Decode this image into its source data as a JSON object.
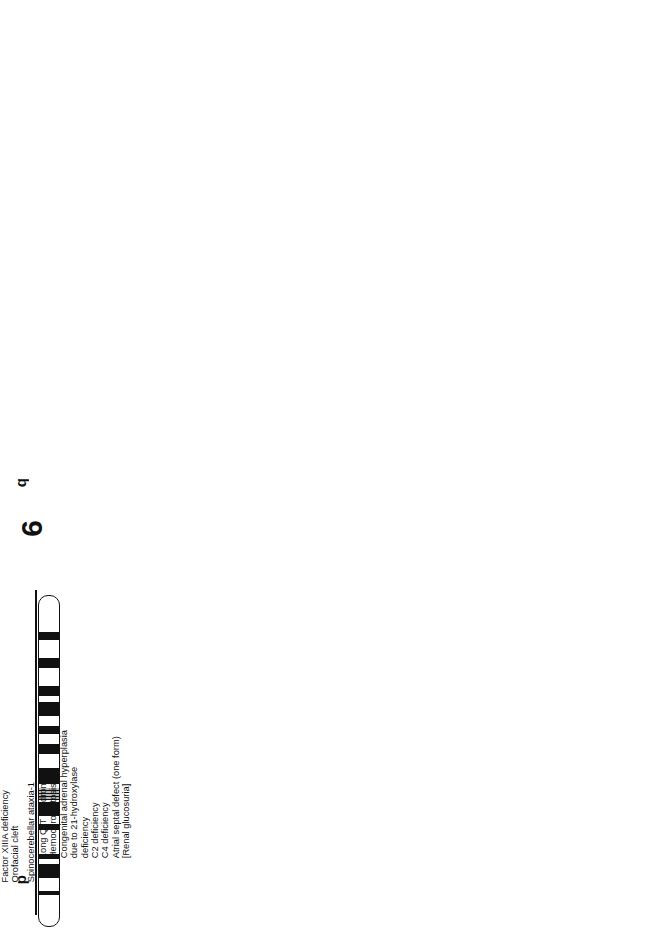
{
  "page": {
    "orientation": "rotated 90 degrees counterclockwise"
  },
  "chromosomes": [
    {
      "number": "6",
      "arms": {
        "p": "p",
        "q": "q"
      },
      "regions_p": [
        "2",
        "1"
      ],
      "regions_q": [
        "1",
        "2"
      ],
      "bands": [
        "25",
        "22",
        "21",
        "12",
        "12",
        "15",
        "16",
        "21",
        "22",
        "24",
        "27"
      ],
      "disease_groups": [
        {
          "boxed": false,
          "items": [
            "Factor XIIIA deficiency",
            "Orofacial cleft"
          ]
        },
        {
          "boxed": false,
          "items": [
            "Spinocerebellar ataxia-1"
          ]
        },
        {
          "boxed": false,
          "items": [
            "Long Q-T syndrome",
            "Hemochromatosis",
            "Congenital adrenal hyperplasia",
            "due to 21-hydroxylase",
            "deficiency",
            "C2 deficiency",
            "C4 deficiency",
            "Atrial septal defect (one form)",
            "[Renal glucosuria]"
          ]
        },
        {
          "boxed": false,
          "items": [
            "Methylmalonicaciduria, one type"
          ]
        },
        {
          "boxed": false,
          "items": [
            "Argininemia"
          ]
        },
        {
          "boxed": false,
          "items": [
            "Macular dystrophy, ?vitelline type"
          ]
        },
        {
          "boxed": true,
          "items": [
            "Dysplasminogenemic thrombophilia",
            "Plasminogen Tochigi disease",
            "Plasminogen deficiency I & II"
          ]
        },
        {
          "boxed": false,
          "items": [
            "[Coronary artery disease,",
            "susceptibility to]"
          ]
        }
      ]
    },
    {
      "number": "7",
      "arms": {
        "p": "p",
        "q": "q"
      },
      "regions_p": [
        "2",
        "1"
      ],
      "regions_q": [
        "1",
        "2",
        "3"
      ],
      "bands": [
        "22",
        "21",
        "15",
        "13",
        "11",
        "11",
        "21",
        "22",
        "31",
        "36"
      ],
      "disease_groups": [
        {
          "boxed": false,
          "items": [
            "Craniosynostosis"
          ]
        },
        {
          "boxed": false,
          "items": [
            "Myopathy due to phosphoglycerate",
            "mutase deficiency"
          ]
        },
        {
          "boxed": false,
          "items": [
            "Greig craniopolysyndactyly"
          ]
        },
        {
          "boxed": false,
          "items": [
            "Argininosuccinicaciduria",
            "Zellweger syndrome"
          ]
        },
        {
          "boxed": true,
          "items": [
            "Ehlers-Danlos syndrome",
            "type VII A2",
            "Osteogenesis imperfecta",
            "(2 or more forms)",
            "Marfan syndrome, atypical"
          ]
        },
        {
          "boxed": false,
          "items": [
            "Mucopolysaccharidosis VII",
            "Hemorrhagic diathesis due to",
            "PAI1 deficiency"
          ]
        },
        {
          "boxed": false,
          "items": [
            "Cystic fibrosis"
          ]
        },
        {
          "boxed": false,
          "items": [
            "Trypsinogen deficiency",
            "Tritan colorblindness",
            "Hemolytic anemia due to",
            "bisphosphoglycerate mutase deficiency"
          ]
        },
        {
          "boxed": false,
          "items": [
            "Lipoamide dehydrogenase",
            "deficiency"
          ]
        }
      ]
    },
    {
      "number": "8",
      "arms": {
        "p": "p",
        "q": "q"
      },
      "regions_p": [
        "2",
        "1"
      ],
      "regions_q": [
        "1",
        "2"
      ],
      "bands": [
        "23",
        "22",
        "12",
        "11",
        "11",
        "12",
        "21",
        "22",
        "23",
        "24"
      ],
      "disease_groups": [
        {
          "boxed": false,
          "items": [
            "Hyperlipoproteinemia I"
          ]
        },
        {
          "boxed": false,
          "items": [
            "Hemolytic anemia due to glutathione",
            "reductase deficiency"
          ]
        },
        {
          "boxed": false,
          "items": [
            "Plasminogen activator deficiency"
          ]
        },
        {
          "boxed": false,
          "items": [
            "Spherocytosis II"
          ]
        },
        {
          "boxed": false,
          "items": [
            "?Hypogonadotropic hypogonadism",
            "due to GNRH deficiency"
          ]
        },
        {
          "boxed": false,
          "items": [
            "Salivary gland pleomorphic adenoma*"
          ]
        },
        {
          "boxed": true,
          "items": [
            "Adrenal hyperplasia, congenital,",
            "due to 11-B-hydroxylase deficiency",
            "CMOII deficiency"
          ]
        },
        {
          "boxed": false,
          "items": [
            "Renal tubular acidosis-",
            "osteopetrosis syndrome"
          ]
        },
        {
          "boxed": false,
          "items": [
            "?Multiple exostoses",
            "Langer-Giedion syndrome*",
            "Trichorhinophalangeal syndrome -1"
          ]
        },
        {
          "boxed": true,
          "items": [
            "?Adolescent multinodular goiter",
            "Hereditary congenital hypothyroidism",
            "(1 or more forms)"
          ]
        },
        {
          "boxed": false,
          "items": [
            "Burkitt lymphoma*",
            "Epidermolysis bullosa, Ogna type",
            "Macular dystrophy, atypical vitelliform"
          ]
        }
      ]
    },
    {
      "number": "9",
      "arms": {
        "p": "p",
        "q": "q"
      },
      "regions_p": [
        "2",
        "1"
      ],
      "regions_q": [
        "1",
        "2",
        "3"
      ],
      "bands": [
        "24",
        "21",
        "13",
        "12",
        "21",
        "22",
        "31",
        "34"
      ],
      "disease_groups": [
        {
          "boxed": false,
          "items": [
            "Interferon deficiency"
          ]
        },
        {
          "boxed": false,
          "items": [
            "Galactosemia"
          ]
        },
        {
          "boxed": false,
          "items": [
            "Friedreich ataxia"
          ]
        },
        {
          "boxed": false,
          "items": [
            "Fructose intolerance"
          ]
        },
        {
          "boxed": true,
          "items": [
            "Citrullinemia",
            "Acute hepatic porphyria",
            "Lead poisoning, suscep-",
            "tibility to"
          ]
        },
        {
          "boxed": false,
          "items": [
            "Nail-patella syndrome"
          ]
        },
        {
          "boxed": false,
          "items": [
            "Hemolytic anemia due",
            "to adenylate",
            "kinase deficiency",
            "Chronic myeloid leukemia*",
            "C5 deficiency"
          ]
        },
        {
          "boxed": false,
          "items": [
            "Tuberous sclerosis-1"
          ]
        },
        {
          "boxed": true,
          "items": [
            "Coproporphyria",
            "Harderoporphyria"
          ]
        }
      ]
    },
    {
      "number": "10",
      "arms": {
        "p": "p",
        "q": "q"
      },
      "regions_p": [
        "1"
      ],
      "regions_q": [
        "1",
        "2"
      ],
      "bands": [
        "15",
        "12",
        "11",
        "11",
        "21",
        "23",
        "25"
      ],
      "disease_groups": [
        {
          "boxed": false,
          "items": [
            "Glioblastoma multiforme"
          ]
        },
        {
          "boxed": false,
          "items": [
            "Hemolytic anemia due to",
            "hexokinase deficiency"
          ]
        },
        {
          "boxed": false,
          "items": [
            "Multiple endocrine neoplasia II",
            "Multiple endocrine neoplasia III"
          ]
        },
        {
          "boxed": false,
          "items": [
            "Metachromatic leukodystrophy",
            "due to deficiency of SAP-1"
          ]
        },
        {
          "boxed": false,
          "items": [
            "Thyroid papillary carcinoma"
          ]
        },
        {
          "boxed": false,
          "items": [
            "Leukemia, T-cell acute lymphocytic*"
          ]
        },
        {
          "boxed": true,
          "items": [
            "Wolman disease",
            "Cholesterol ester storage disease"
          ]
        },
        {
          "boxed": true,
          "items": [
            "Ornithinemia,",
            "B6-responsive & B6-unresponsive"
          ]
        },
        {
          "boxed": false,
          "items": [
            "Gyrate atrophy of choroid and retina"
          ]
        },
        {
          "boxed": false,
          "items": [
            "Adrenal hyperplasia V",
            "Chronic granulomatous disease due to deficiency",
            "of NCF-1",
            "Retinol binding protein, deficiency of",
            "?Sialidosis"
          ]
        }
      ]
    },
    {
      "number": "11",
      "arms": {
        "p": "p",
        "q": "q"
      },
      "regions_p": [
        "1"
      ],
      "regions_q": [
        "1",
        "2"
      ],
      "bands": [
        "15",
        "14",
        "11",
        "13",
        "22",
        "23"
      ],
      "disease_groups": [
        {
          "boxed": false,
          "items": [
            "Rhabdomyosarcoma",
            "Adrenocortical carcinoma",
            "Beckwith-Wiedemann syndrome*",
            "Manic-depressive illness"
          ]
        },
        {
          "boxed": true,
          "items": [
            "Hyperproinsulinemia, familial",
            "MODY",
            "Diabetes mellitus, rare form"
          ]
        },
        {
          "boxed": false,
          "items": [
            "Heterocellular hereditary persistence of fetal hemoglobin"
          ]
        },
        {
          "boxed": true,
          "items": [
            "Sickle cell anemia",
            "B-thalassemias",
            "B-methemoglobinemias",
            "B-erythremias",
            "B-Heinz body anemias",
            "HPFH, deletion type"
          ]
        },
        {
          "boxed": false,
          "items": [
            "HPFH, nondeletion types A, G",
            "Wilms tumor, type 2*"
          ]
        },
        {
          "boxed": false,
          "items": [
            "Wilms tumor*",
            "Aniridia-2*",
            "Acatalasemia",
            "Leukemia, acute T-cell*"
          ]
        },
        {
          "boxed": true,
          "items": [
            "Hypoprothrombinemia",
            "Dysprothrombinemia"
          ]
        },
        {
          "boxed": false,
          "items": [
            "Exertional myoglobinuria due to LDH-A deficiency",
            "Liver cell carcinoma"
          ]
        },
        {
          "boxed": false,
          "items": [
            "Angioedema, hereditary"
          ]
        },
        {
          "boxed": false,
          "items": [
            "B-cell leukemia/lymphoma*",
            "Albinism"
          ]
        },
        {
          "boxed": false,
          "items": [
            "Ataxia telangiectasia"
          ]
        },
        {
          "boxed": false,
          "items": [
            "Pyruvate carboxylase deficiency",
            "Multiple endocrine neoplasia, type I*",
            "McArdle disease",
            "Epidermolysis bullosa dystrophica, recessive"
          ]
        },
        {
          "boxed": false,
          "items": [
            "Acute intermittent porphyria",
            "Anal canal carcinoma"
          ]
        },
        {
          "boxed": true,
          "items": [
            "Combined apoA-I/C-III deficiency",
            "Hypertriglyceridemia (1 form)",
            "Hypoalphalipoproteinemia",
            "Amyloidosis, Iowa form"
          ]
        },
        {
          "boxed": false,
          "items": [
            "Glaucoma, congenital"
          ]
        }
      ]
    },
    {
      "number": "12",
      "arms": {
        "p": "p",
        "q": "q"
      },
      "regions_p": [
        "1"
      ],
      "regions_q": [
        "1",
        "2"
      ],
      "bands": [
        "13",
        "12",
        "11",
        "12",
        "13",
        "21",
        "24"
      ],
      "disease_groups": [
        {
          "boxed": false,
          "items": [
            "Eosinophilic myeloproliferative disorder",
            "C1r/C1s deficiency, combined",
            "Hemolytic anemia due to triosephosphate",
            "isomerase deficiency"
          ]
        },
        {
          "boxed": false,
          "items": [
            "von Willebrand disease"
          ]
        },
        {
          "boxed": true,
          "items": [
            "Colorectal adenoma",
            "?Colorectal cancer*"
          ]
        },
        {
          "boxed": true,
          "items": [
            "Stickler syndrome",
            "Spondyloepiphyseal dysplasia",
            "congenita",
            "?Kniest dysplasia",
            "Langer-Saldino achondrogenesis",
            "Osteoarthrosis, precocious"
          ]
        },
        {
          "boxed": false,
          "items": [
            "Glioma*"
          ]
        },
        {
          "boxed": true,
          "items": [
            "Lipoma*",
            "Myxoid liposarcoma*"
          ]
        },
        {
          "boxed": false,
          "items": [
            "Sanfilippo syndrome D",
            "Acyl-CoA dehydrogenase,",
            "short chain, deficiency"
          ]
        },
        {
          "boxed": false,
          "items": [
            "Vitamin D dependency, type I"
          ]
        },
        {
          "boxed": false,
          "items": [
            "Immune interferon deficiency"
          ]
        },
        {
          "boxed": true,
          "items": [
            "Phenylketonuria",
            "[Hyperphenylalaninemia, mild]"
          ]
        },
        {
          "boxed": true,
          "items": [
            "Acute alcohol intolerance",
            "?Fetal alcohol syndrome"
          ]
        },
        {
          "boxed": false,
          "items": [
            "?Brody myopathy",
            "[Histidemia]"
          ]
        }
      ]
    }
  ]
}
